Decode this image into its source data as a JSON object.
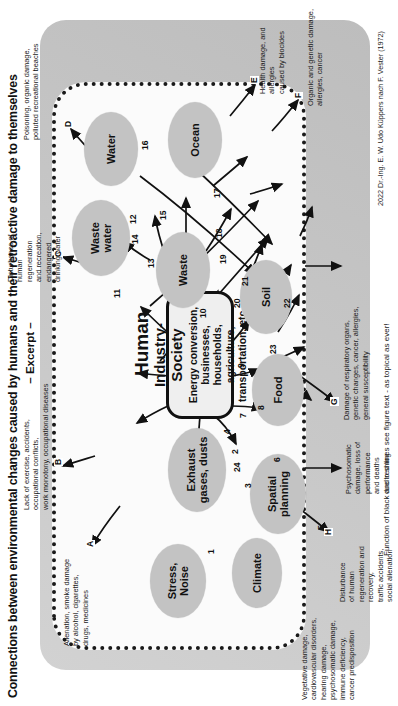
{
  "figure": {
    "headline": "Connections between environmental changes caused by humans and their retroactive damage to themselves",
    "subhead": "– Excerpt –",
    "credit": "2022 Dr.-Ing. E. W. Udo Küppers nach F. Vester (1972)",
    "caption": "Function of black and red lines see figure text - as topical as ever!"
  },
  "center": {
    "title": "Industry-Society",
    "subtitle": "Energy conversion, businesses,\nhouseholds, agriculture,\ntransportation, etc."
  },
  "human": {
    "label": "Human"
  },
  "nodes": [
    {
      "id": "stress",
      "label": "Stress,\nNoise"
    },
    {
      "id": "climate",
      "label": "Climate"
    },
    {
      "id": "spatial",
      "label": "Spatial\nplanning"
    },
    {
      "id": "exhaust",
      "label": "Exhaust\ngases, dusts"
    },
    {
      "id": "food",
      "label": "Food"
    },
    {
      "id": "waste",
      "label": "Waste"
    },
    {
      "id": "soil",
      "label": "Soil"
    },
    {
      "id": "wastewater",
      "label": "Waste\nwater"
    },
    {
      "id": "water",
      "label": "Water"
    },
    {
      "id": "ocean",
      "label": "Ocean"
    }
  ],
  "edge_numbers": [
    "1",
    "2",
    "3",
    "4",
    "5",
    "6",
    "7",
    "8",
    "9",
    "10",
    "11",
    "12",
    "13",
    "14",
    "15",
    "16",
    "17",
    "18",
    "19",
    "20",
    "21",
    "22",
    "23",
    "24"
  ],
  "boundary_tags": [
    "A",
    "B",
    "C",
    "D",
    "E",
    "F",
    "G",
    "H"
  ],
  "annotations": [
    {
      "id": "annot-a",
      "tag": "A",
      "text": "Alienation, smoke damage\nby alcohol, cigarettes,\ndrugs, medicines"
    },
    {
      "id": "annot-vegetative",
      "tag": "",
      "text": "Vegetative damage,\ncardiovascular disorders,\nhearing damage,\npsychosomatic damage,\nimmune deficiency,\ncancer predisposition"
    },
    {
      "id": "annot-b",
      "tag": "B",
      "text": "Lack of exercise, accidents,\noccupational conflicts,\nwork monotony, occupational diseases"
    },
    {
      "id": "annot-c",
      "tag": "C",
      "text": "Disturbance of\nhuman\nregeneration\nand recreation,\nendangered\ndrinking water"
    },
    {
      "id": "annot-d",
      "tag": "D",
      "text": "Poisoning, organic damage,\npolluted recreational beaches"
    },
    {
      "id": "annot-e",
      "tag": "E",
      "text": "Health damage, and allergies\ncaused by biocides"
    },
    {
      "id": "annot-f",
      "tag": "F",
      "text": "Organic and genetic damage,\nallergies, cancer"
    },
    {
      "id": "annot-g",
      "tag": "G",
      "text": "Damage of respiratory organs,\ngenetic changes, cancer, allergies,\ngeneral susceptibility"
    },
    {
      "id": "annot-h",
      "tag": "H",
      "text": "Disturbance\nof human\nregeneration and\nrecovery,\ntraffic accidents,\nsocial alienation"
    },
    {
      "id": "annot-smog",
      "tag": "",
      "text": "Psychosomatic\ndamage, loss of\nperformance\nand deaths\ndue to smog"
    }
  ],
  "colors": {
    "node_fill": "#c3c3c3",
    "panel": "#c9c9c9",
    "boundary": "#1a1a1a",
    "ink": "#111111"
  }
}
